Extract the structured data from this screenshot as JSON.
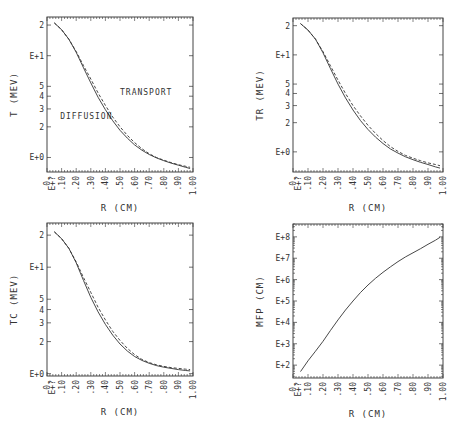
{
  "chart_data": [
    {
      "type": "line",
      "id": "T",
      "title": "",
      "xlabel": "R (CM)",
      "ylabel": "T (MEV)",
      "yscale": "log",
      "xlim": [
        0.0,
        1.0
      ],
      "ylim": [
        0.72,
        24
      ],
      "frame": {
        "left": 47,
        "top": 17,
        "right": 193,
        "bottom": 172
      },
      "x_tick_labels": [
        "0.",
        "E+?",
        ".10",
        ".20",
        ".30",
        ".40",
        ".50",
        ".60",
        ".70",
        ".80",
        ".90",
        "1.00"
      ],
      "y_tick_labels": [
        {
          "label": "2",
          "value": 20
        },
        {
          "label": "E+1",
          "value": 10
        },
        {
          "label": "5",
          "value": 5
        },
        {
          "label": "4",
          "value": 4
        },
        {
          "label": "3",
          "value": 3
        },
        {
          "label": "2",
          "value": 2
        },
        {
          "label": "E+0",
          "value": 1
        }
      ],
      "series": [
        {
          "name": "DIFFUSION",
          "style": "solid",
          "x": [
            0.05,
            0.1,
            0.15,
            0.2,
            0.25,
            0.3,
            0.35,
            0.4,
            0.45,
            0.5,
            0.55,
            0.6,
            0.65,
            0.7,
            0.75,
            0.8,
            0.85,
            0.9,
            0.95,
            0.98
          ],
          "y": [
            21.0,
            18.0,
            14.5,
            10.8,
            7.6,
            5.4,
            3.9,
            2.95,
            2.3,
            1.85,
            1.55,
            1.33,
            1.18,
            1.07,
            0.99,
            0.93,
            0.88,
            0.84,
            0.8,
            0.78
          ]
        },
        {
          "name": "TRANSPORT",
          "style": "dashed",
          "x": [
            0.05,
            0.1,
            0.15,
            0.2,
            0.25,
            0.3,
            0.35,
            0.4,
            0.45,
            0.5,
            0.55,
            0.6,
            0.65,
            0.7,
            0.75,
            0.8,
            0.85,
            0.9,
            0.95,
            0.98
          ],
          "y": [
            21.0,
            18.0,
            14.5,
            11.0,
            8.0,
            5.9,
            4.3,
            3.25,
            2.5,
            2.0,
            1.65,
            1.4,
            1.22,
            1.09,
            1.0,
            0.94,
            0.89,
            0.85,
            0.82,
            0.8
          ]
        }
      ],
      "annotations": [
        {
          "text": "TRANSPORT",
          "x": 0.5,
          "y": 4.1
        },
        {
          "text": "DIFFUSION",
          "x": 0.09,
          "y": 2.4
        }
      ]
    },
    {
      "type": "line",
      "id": "TR",
      "title": "",
      "xlabel": "R (CM)",
      "ylabel": "TR (MEV)",
      "yscale": "log",
      "xlim": [
        0.0,
        1.0
      ],
      "ylim": [
        0.62,
        24
      ],
      "frame": {
        "left": 293,
        "top": 18,
        "right": 443,
        "bottom": 172
      },
      "x_tick_labels": [
        "0.",
        "E+?",
        ".10",
        ".20",
        ".30",
        ".40",
        ".50",
        ".60",
        ".70",
        ".80",
        ".90",
        "1.00"
      ],
      "y_tick_labels": [
        {
          "label": "2",
          "value": 20
        },
        {
          "label": "E+1",
          "value": 10
        },
        {
          "label": "5",
          "value": 5
        },
        {
          "label": "4",
          "value": 4
        },
        {
          "label": "3",
          "value": 3
        },
        {
          "label": "2",
          "value": 2
        },
        {
          "label": "E+0",
          "value": 1
        }
      ],
      "series": [
        {
          "name": "DIFFUSION",
          "style": "solid",
          "x": [
            0.05,
            0.1,
            0.15,
            0.2,
            0.25,
            0.3,
            0.35,
            0.4,
            0.45,
            0.5,
            0.55,
            0.6,
            0.65,
            0.7,
            0.75,
            0.8,
            0.85,
            0.9,
            0.95,
            0.98
          ],
          "y": [
            21.0,
            18.0,
            14.5,
            10.5,
            7.2,
            5.0,
            3.6,
            2.7,
            2.1,
            1.7,
            1.42,
            1.22,
            1.07,
            0.97,
            0.89,
            0.83,
            0.78,
            0.74,
            0.7,
            0.68
          ]
        },
        {
          "name": "TRANSPORT",
          "style": "dashed",
          "x": [
            0.05,
            0.1,
            0.15,
            0.2,
            0.25,
            0.3,
            0.35,
            0.4,
            0.45,
            0.5,
            0.55,
            0.6,
            0.65,
            0.7,
            0.75,
            0.8,
            0.85,
            0.9,
            0.95,
            0.98
          ],
          "y": [
            21.0,
            18.0,
            14.5,
            10.8,
            7.7,
            5.5,
            4.0,
            3.0,
            2.35,
            1.88,
            1.55,
            1.31,
            1.13,
            1.01,
            0.92,
            0.86,
            0.81,
            0.77,
            0.74,
            0.72
          ]
        }
      ],
      "annotations": []
    },
    {
      "type": "line",
      "id": "TC",
      "title": "",
      "xlabel": "R (CM)",
      "ylabel": "TC (MEV)",
      "yscale": "log",
      "xlim": [
        0.0,
        1.0
      ],
      "ylim": [
        0.95,
        26
      ],
      "frame": {
        "left": 47,
        "top": 223,
        "right": 193,
        "bottom": 376
      },
      "x_tick_labels": [
        "0.",
        "E+?",
        ".10",
        ".20",
        ".30",
        ".40",
        ".50",
        ".60",
        ".70",
        ".80",
        ".90",
        "1.00"
      ],
      "y_tick_labels": [
        {
          "label": "2",
          "value": 20
        },
        {
          "label": "E+1",
          "value": 10
        },
        {
          "label": "5",
          "value": 5
        },
        {
          "label": "4",
          "value": 4
        },
        {
          "label": "3",
          "value": 3
        },
        {
          "label": "2",
          "value": 2
        },
        {
          "label": "E+0",
          "value": 1
        }
      ],
      "series": [
        {
          "name": "DIFFUSION",
          "style": "solid",
          "x": [
            0.05,
            0.1,
            0.15,
            0.2,
            0.25,
            0.3,
            0.35,
            0.4,
            0.45,
            0.5,
            0.55,
            0.6,
            0.65,
            0.7,
            0.75,
            0.8,
            0.85,
            0.9,
            0.95,
            0.98
          ],
          "y": [
            21.5,
            18.5,
            15.0,
            11.0,
            7.5,
            5.2,
            3.8,
            2.9,
            2.3,
            1.9,
            1.63,
            1.45,
            1.33,
            1.25,
            1.19,
            1.15,
            1.12,
            1.09,
            1.07,
            1.06
          ]
        },
        {
          "name": "TRANSPORT",
          "style": "dashed",
          "x": [
            0.05,
            0.1,
            0.15,
            0.2,
            0.25,
            0.3,
            0.35,
            0.4,
            0.45,
            0.5,
            0.55,
            0.6,
            0.65,
            0.7,
            0.75,
            0.8,
            0.85,
            0.9,
            0.95,
            0.98
          ],
          "y": [
            21.5,
            18.5,
            15.0,
            11.2,
            8.0,
            5.8,
            4.2,
            3.2,
            2.5,
            2.05,
            1.73,
            1.51,
            1.36,
            1.27,
            1.21,
            1.17,
            1.14,
            1.12,
            1.1,
            1.09
          ]
        }
      ],
      "annotations": []
    },
    {
      "type": "line",
      "id": "MFP",
      "title": "",
      "xlabel": "R (CM)",
      "ylabel": "MFP (CM)",
      "yscale": "log",
      "xlim": [
        0.0,
        1.0
      ],
      "ylim": [
        25,
        400000000
      ],
      "frame": {
        "left": 293,
        "top": 224,
        "right": 443,
        "bottom": 378
      },
      "x_tick_labels": [
        "0.",
        "E+?",
        ".10",
        ".20",
        ".30",
        ".40",
        ".50",
        ".60",
        ".70",
        ".80",
        ".90",
        "1.00"
      ],
      "y_tick_labels": [
        {
          "label": "E+8",
          "value": 100000000
        },
        {
          "label": "E+7",
          "value": 10000000
        },
        {
          "label": "E+6",
          "value": 1000000
        },
        {
          "label": "E+5",
          "value": 100000
        },
        {
          "label": "E+4",
          "value": 10000
        },
        {
          "label": "E+3",
          "value": 1000
        },
        {
          "label": "E+2",
          "value": 100
        }
      ],
      "series": [
        {
          "name": "MFP",
          "style": "solid",
          "x": [
            0.05,
            0.1,
            0.15,
            0.2,
            0.25,
            0.3,
            0.35,
            0.4,
            0.45,
            0.5,
            0.55,
            0.6,
            0.65,
            0.7,
            0.75,
            0.8,
            0.85,
            0.9,
            0.95,
            0.98
          ],
          "y": [
            50,
            160,
            450,
            1300,
            4200,
            13000,
            38000,
            100000,
            250000,
            560000,
            1150000,
            2200000,
            4000000,
            7000000,
            11500000,
            18000000,
            28000000,
            45000000,
            70000000,
            95000000
          ]
        }
      ],
      "annotations": []
    }
  ],
  "panels": {
    "T": {
      "ylabel": "T (MEV)",
      "xlabel": "R (CM)",
      "anno_transport": "TRANSPORT",
      "anno_diffusion": "DIFFUSION"
    },
    "TR": {
      "ylabel": "TR (MEV)",
      "xlabel": "R (CM)"
    },
    "TC": {
      "ylabel": "TC (MEV)",
      "xlabel": "R (CM)"
    },
    "MFP": {
      "ylabel": "MFP (CM)",
      "xlabel": "R (CM)"
    }
  },
  "colors": {
    "ink": "#333333",
    "frame": "#444444",
    "background": "#ffffff"
  }
}
